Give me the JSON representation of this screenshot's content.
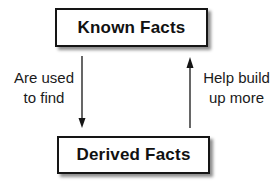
{
  "diagram": {
    "nodes": [
      {
        "id": "known",
        "label": "Known Facts"
      },
      {
        "id": "derived",
        "label": "Derived Facts"
      }
    ],
    "edges": [
      {
        "from": "known",
        "to": "derived",
        "label_lines": [
          "Are used",
          "to find"
        ]
      },
      {
        "from": "derived",
        "to": "known",
        "label_lines": [
          "Help build",
          "up more"
        ]
      }
    ]
  },
  "colors": {
    "stroke": "#151515",
    "background": "#ffffff",
    "text": "#111111"
  }
}
